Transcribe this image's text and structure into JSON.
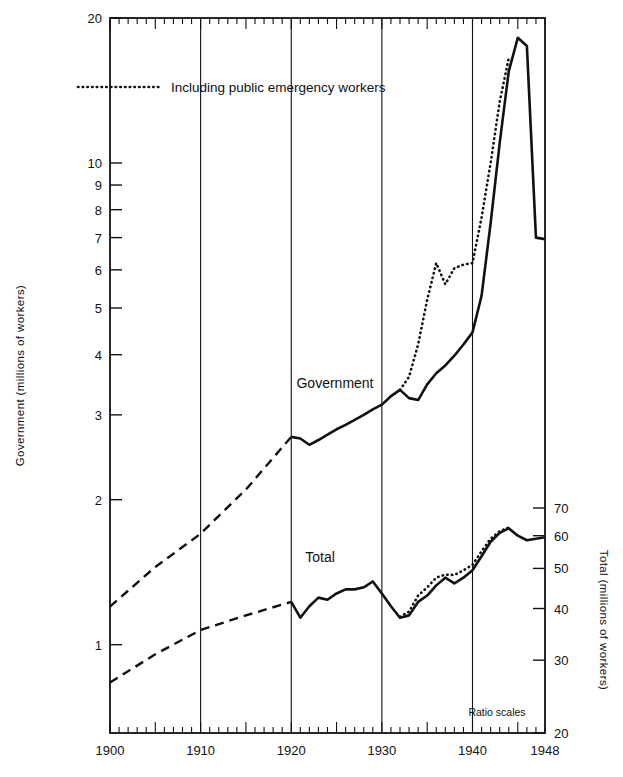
{
  "figure": {
    "partial_title": "",
    "note": "Ratio scales",
    "legend": {
      "dotted_label": "Including public emergency workers"
    },
    "series_labels": {
      "government": "Government",
      "total": "Total"
    }
  },
  "axes": {
    "left": {
      "title": "Government (millions of workers)",
      "tick_labels": [
        "20",
        "10",
        "9",
        "8",
        "7",
        "6",
        "5",
        "4",
        "3",
        "2",
        "1"
      ],
      "scale": "log",
      "range": [
        0.62,
        20
      ]
    },
    "right": {
      "title": "Total (millions of workers)",
      "tick_labels": [
        "70",
        "60",
        "50",
        "40",
        "30",
        "20"
      ],
      "scale": "log",
      "range": [
        20,
        76
      ]
    },
    "bottom": {
      "tick_labels": [
        "1900",
        "1910",
        "1920",
        "1930",
        "1940",
        "1948"
      ],
      "range": [
        1900,
        1948
      ]
    }
  },
  "chart_data": {
    "type": "line",
    "xlabel": "",
    "ylabel": "Government (millions of workers)",
    "y2label": "Total (millions of workers)",
    "xlim": [
      1900,
      1948
    ],
    "ylim": [
      0.62,
      20
    ],
    "y2lim": [
      20,
      76
    ],
    "yscale": "log",
    "y2scale": "log",
    "grid": "vertical-decade",
    "legend": "Including public emergency workers",
    "annotations": [
      "Ratio scales",
      "Government",
      "Total"
    ],
    "series": [
      {
        "name": "Government",
        "axis": "left",
        "style": "solid-with-dashed-early",
        "dashed_through": 1920,
        "x": [
          1900,
          1905,
          1910,
          1915,
          1920,
          1921,
          1922,
          1923,
          1924,
          1925,
          1926,
          1927,
          1928,
          1929,
          1930,
          1931,
          1932,
          1933,
          1934,
          1935,
          1936,
          1937,
          1938,
          1939,
          1940,
          1941,
          1942,
          1943,
          1944,
          1945,
          1946,
          1947,
          1948
        ],
        "values": [
          1.2,
          1.45,
          1.7,
          2.1,
          2.7,
          2.68,
          2.6,
          2.66,
          2.73,
          2.8,
          2.86,
          2.93,
          3.0,
          3.08,
          3.15,
          3.28,
          3.38,
          3.25,
          3.22,
          3.47,
          3.66,
          3.8,
          3.98,
          4.2,
          4.45,
          5.3,
          7.5,
          11.0,
          15.5,
          18.2,
          17.5,
          7.0,
          6.95
        ]
      },
      {
        "name": "Government including public emergency workers",
        "axis": "left",
        "style": "dotted",
        "x": [
          1932,
          1933,
          1934,
          1935,
          1936,
          1937,
          1938,
          1939,
          1940,
          1941,
          1942,
          1943,
          1944
        ],
        "values": [
          3.38,
          3.6,
          4.2,
          5.2,
          6.2,
          5.6,
          6.05,
          6.15,
          6.2,
          7.7,
          10.0,
          13.4,
          16.5
        ]
      },
      {
        "name": "Total",
        "axis": "right",
        "style": "solid-with-dashed-early",
        "dashed_through": 1920,
        "x": [
          1900,
          1905,
          1910,
          1915,
          1920,
          1921,
          1922,
          1923,
          1924,
          1925,
          1926,
          1927,
          1928,
          1929,
          1930,
          1931,
          1932,
          1933,
          1934,
          1935,
          1936,
          1937,
          1938,
          1939,
          1940,
          1941,
          1942,
          1943,
          1944,
          1945,
          1946,
          1947,
          1948
        ],
        "values": [
          26.5,
          31.0,
          35.5,
          38.5,
          41.5,
          38.0,
          40.5,
          42.5,
          42.0,
          43.5,
          44.5,
          44.5,
          45.0,
          46.5,
          43.5,
          40.5,
          38.0,
          38.5,
          41.5,
          43.0,
          45.5,
          47.5,
          46.0,
          47.5,
          49.5,
          53.5,
          58.0,
          61.0,
          62.5,
          60.0,
          58.5,
          59.0,
          59.5
        ]
      },
      {
        "name": "Total including public emergency workers",
        "axis": "right",
        "style": "dotted",
        "x": [
          1932,
          1933,
          1934,
          1935,
          1936,
          1937,
          1938,
          1939,
          1940,
          1941,
          1942,
          1943,
          1944
        ],
        "values": [
          38.2,
          39.3,
          43.0,
          45.0,
          47.5,
          48.3,
          48.2,
          49.5,
          51.0,
          55.0,
          59.0,
          61.5,
          62.8
        ]
      }
    ]
  }
}
